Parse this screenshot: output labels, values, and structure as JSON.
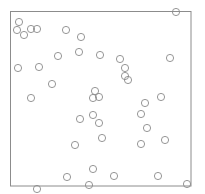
{
  "chart_data": {
    "type": "scatter",
    "title": "",
    "xlabel": "",
    "ylabel": "",
    "grid": false,
    "legend": null,
    "frame": {
      "x": 10.5,
      "y": 11.5,
      "width": 180.5,
      "height": 174.5,
      "stroke": "#8c8c8c"
    },
    "marker": {
      "shape": "circle",
      "radius": 3.6,
      "fill": "none",
      "stroke": "#8a8a8a"
    },
    "points": [
      {
        "x": 176,
        "y": 12
      },
      {
        "x": 19,
        "y": 22
      },
      {
        "x": 17,
        "y": 30
      },
      {
        "x": 31,
        "y": 29
      },
      {
        "x": 37,
        "y": 29
      },
      {
        "x": 24,
        "y": 35
      },
      {
        "x": 66,
        "y": 30
      },
      {
        "x": 81,
        "y": 37
      },
      {
        "x": 79,
        "y": 52
      },
      {
        "x": 58,
        "y": 56
      },
      {
        "x": 100,
        "y": 55
      },
      {
        "x": 120,
        "y": 59
      },
      {
        "x": 170,
        "y": 58
      },
      {
        "x": 18,
        "y": 68
      },
      {
        "x": 39,
        "y": 67
      },
      {
        "x": 125,
        "y": 68
      },
      {
        "x": 125,
        "y": 76
      },
      {
        "x": 128,
        "y": 80
      },
      {
        "x": 52,
        "y": 84
      },
      {
        "x": 95,
        "y": 91
      },
      {
        "x": 93,
        "y": 98
      },
      {
        "x": 99,
        "y": 97
      },
      {
        "x": 31,
        "y": 98
      },
      {
        "x": 161,
        "y": 97
      },
      {
        "x": 145,
        "y": 103
      },
      {
        "x": 141,
        "y": 114
      },
      {
        "x": 93,
        "y": 115
      },
      {
        "x": 80,
        "y": 119
      },
      {
        "x": 99,
        "y": 123
      },
      {
        "x": 147,
        "y": 128
      },
      {
        "x": 102,
        "y": 138
      },
      {
        "x": 165,
        "y": 140
      },
      {
        "x": 75,
        "y": 145
      },
      {
        "x": 141,
        "y": 144
      },
      {
        "x": 93,
        "y": 169
      },
      {
        "x": 67,
        "y": 177
      },
      {
        "x": 114,
        "y": 176
      },
      {
        "x": 158,
        "y": 176
      },
      {
        "x": 89,
        "y": 185
      },
      {
        "x": 187,
        "y": 184
      },
      {
        "x": 37,
        "y": 189
      }
    ]
  }
}
